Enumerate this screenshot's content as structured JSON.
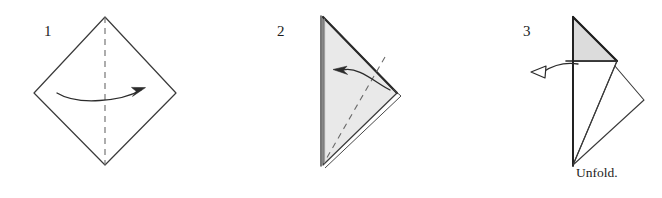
{
  "figure": {
    "kind": "origami-fold-instruction-diagram",
    "background_color": "#ffffff",
    "ink_color": "#1c1c1c",
    "paper_front_color": "#ffffff",
    "paper_back_color": "#e4e4e4"
  },
  "steps": [
    {
      "number": "1",
      "caption": "",
      "shape_name": "square-rotated-diamond",
      "fold_line": "vertical-valley-dashed",
      "arrow": "fold-right-solid-arrow"
    },
    {
      "number": "2",
      "caption": "",
      "shape_name": "right-pointing-triangle",
      "fold_line": "diagonal-valley-dashed",
      "arrow": "fold-left-solid-arrow"
    },
    {
      "number": "3",
      "caption": "Unfold.",
      "shape_name": "folded-kite-with-shaded-flap",
      "fold_line": "none",
      "arrow": "unfold-hollow-arrow"
    }
  ]
}
